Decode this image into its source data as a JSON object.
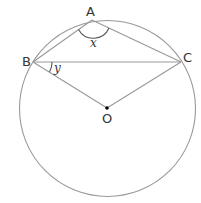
{
  "diagram": {
    "type": "circle-geometry",
    "points": {
      "A": {
        "label": "A"
      },
      "B": {
        "label": "B"
      },
      "C": {
        "label": "C"
      },
      "O": {
        "label": "O"
      }
    },
    "angles": {
      "x": {
        "label": "x",
        "vertex": "A"
      },
      "y": {
        "label": "y",
        "vertex": "B"
      }
    },
    "colors": {
      "stroke": "#999999",
      "text": "#333333",
      "center_dot": "#000000"
    }
  }
}
